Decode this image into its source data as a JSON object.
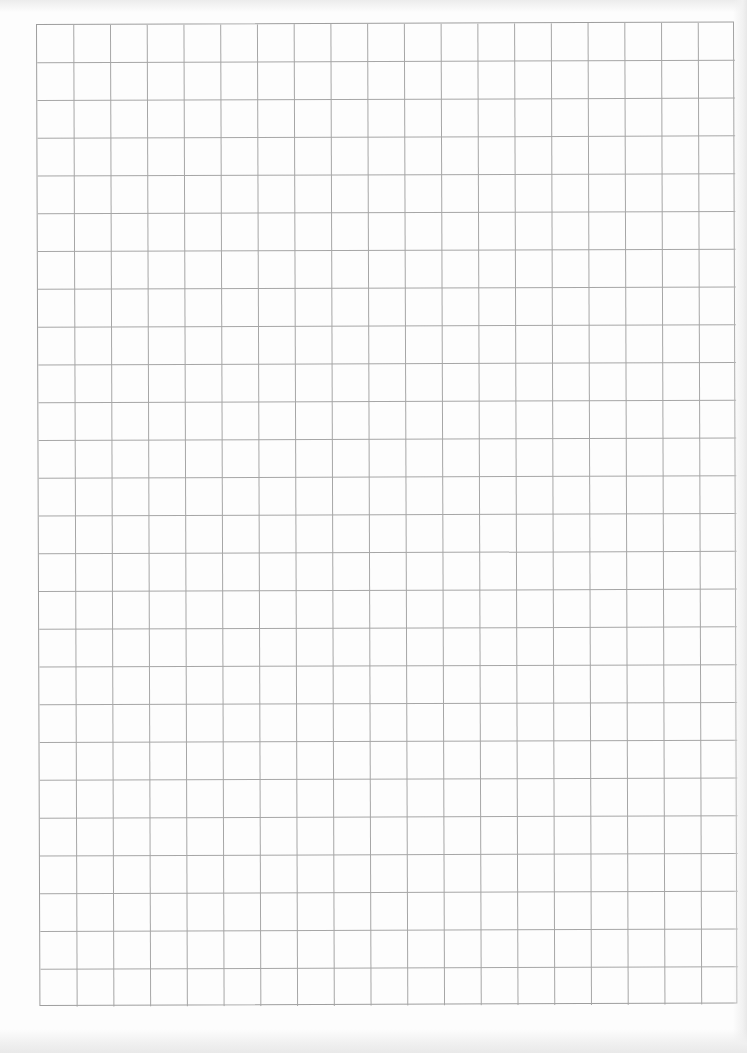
{
  "document": {
    "type": "grid-paper",
    "background_color": "#fdfdfd",
    "line_color": "#a6a6a6",
    "border_color": "#9e9e9e"
  },
  "grid": {
    "columns": 19,
    "rows": 26,
    "cell_width": 36.74,
    "cell_height": 37.77,
    "left": 36,
    "top": 24,
    "width": 698,
    "height": 982
  }
}
